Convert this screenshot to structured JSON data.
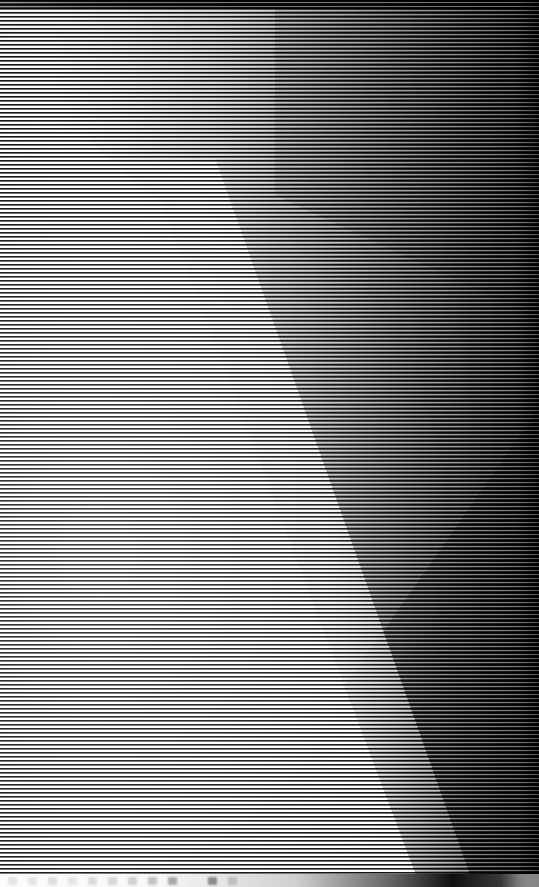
{
  "capture": {
    "kind": "corrupted-screenshot",
    "description": "Severely corrupted screen capture: the frame is overwritten by a dense horizontal interlace grating, leaving no legible interface text.",
    "width": 539,
    "height": 887,
    "readable_text": "none",
    "legibility": "No window titles, labels, buttons or body text are recoverable from the pixels."
  },
  "artifact": {
    "type": "horizontal-scanline-interlace",
    "period_px": 4,
    "dark_line_px": 2,
    "gap_px": 2,
    "orientation": "horizontal",
    "coverage": "full-frame"
  },
  "regions": {
    "top_bar": {
      "name": "smeared-title-bar",
      "height_px": 9,
      "appearance": "near-black band spanning the full width with faint mottling"
    },
    "bright_wedge": {
      "name": "bright-diagonal-wedge",
      "apex_approx": [
        30,
        85
      ],
      "base_right_approx": [
        420,
        887
      ],
      "appearance": "large white wedge opening downward along the left side"
    },
    "dark_mass": {
      "name": "dark-upper-right-mass",
      "appearance": "dark region filling the upper-right, bounded by a diagonal running down to the right edge"
    },
    "secondary_fold": {
      "name": "secondary-diagonal-edge",
      "from_approx": [
        275,
        200
      ],
      "to_approx": [
        539,
        320
      ],
      "appearance": "shorter diagonal crease above the main wedge"
    },
    "taskbar": {
      "name": "bottom-taskbar-strip",
      "height_px": 13,
      "appearance": "a row of evenly spaced blurred icon blobs across the bottom edge, too degraded to identify",
      "icon_count": 12,
      "icons": [
        {
          "name": "taskbar-icon-1",
          "color": "#c9c9c9"
        },
        {
          "name": "taskbar-icon-2",
          "color": "#cccccc"
        },
        {
          "name": "taskbar-icon-3",
          "color": "#c2c2c2"
        },
        {
          "name": "taskbar-icon-4",
          "color": "#d0d0d0"
        },
        {
          "name": "taskbar-icon-5",
          "color": "#bdbdbd"
        },
        {
          "name": "taskbar-icon-6",
          "color": "#b6b6b6"
        },
        {
          "name": "taskbar-icon-7",
          "color": "#a8a8a8"
        },
        {
          "name": "taskbar-icon-8",
          "color": "#8e8e8e"
        },
        {
          "name": "taskbar-icon-9",
          "color": "#5a5a5a"
        },
        {
          "name": "taskbar-icon-10",
          "color": "#eaeaea"
        },
        {
          "name": "taskbar-icon-11",
          "color": "#2b2b2b"
        },
        {
          "name": "taskbar-icon-12",
          "color": "#9a9a9a"
        }
      ]
    }
  },
  "colors": {
    "brightest": "#ffffff",
    "darkest": "#000000",
    "midtone": "#9c9c9c",
    "scanline_dark": "#0a0a0a",
    "background": "#ffffff"
  }
}
